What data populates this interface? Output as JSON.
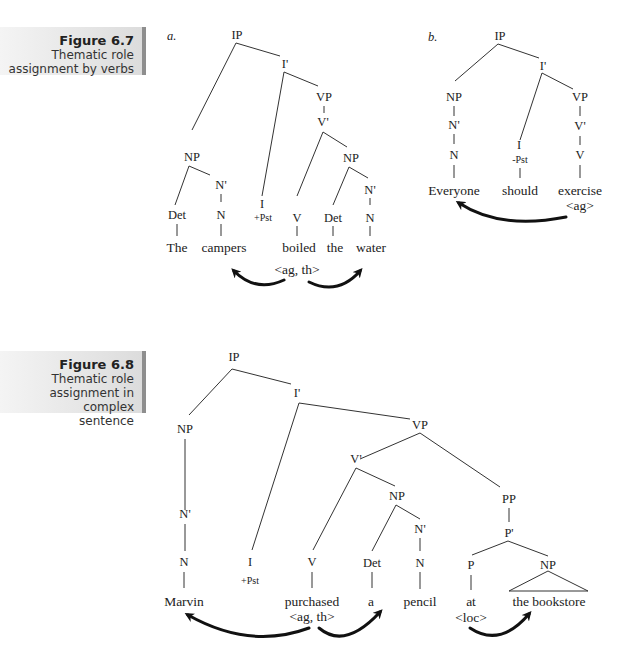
{
  "figures": [
    {
      "number": "Figure 6.7",
      "caption_lines": [
        "Thematic role",
        "assignment by verbs"
      ],
      "panels": [
        {
          "label": "a.",
          "nodes": {
            "ip": "IP",
            "ibar": "I'",
            "vp": "VP",
            "vbar": "V'",
            "np_subj": "NP",
            "nbar_subj": "N'",
            "det1": "Det",
            "n1": "N",
            "i": "I",
            "i_feat": "+Pst",
            "v": "V",
            "np_obj": "NP",
            "det2": "Det",
            "nbar_obj": "N'",
            "n2": "N"
          },
          "words": [
            "The",
            "campers",
            "boiled",
            "the",
            "water"
          ],
          "theta_grid": "<ag, th>"
        },
        {
          "label": "b.",
          "nodes": {
            "ip": "IP",
            "ibar": "I'",
            "np": "NP",
            "nbar": "N'",
            "n": "N",
            "i": "I",
            "i_feat": "-Pst",
            "vp": "VP",
            "vbar": "V'",
            "v": "V"
          },
          "words": [
            "Everyone",
            "should",
            "exercise"
          ],
          "theta_grid": "<ag>"
        }
      ]
    },
    {
      "number": "Figure 6.8",
      "caption_lines": [
        "Thematic role",
        "assignment in complex",
        "sentence"
      ],
      "nodes": {
        "ip": "IP",
        "ibar": "I'",
        "np_subj": "NP",
        "nbar_subj": "N'",
        "n_subj": "N",
        "i": "I",
        "i_feat": "+Pst",
        "vp": "VP",
        "vbar": "V'",
        "v": "V",
        "np_obj": "NP",
        "det": "Det",
        "nbar_obj": "N'",
        "n_obj": "N",
        "pp": "PP",
        "pbar": "P'",
        "p": "P",
        "np_pp": "NP"
      },
      "words": [
        "Marvin",
        "purchased",
        "a",
        "pencil",
        "at",
        "the bookstore"
      ],
      "theta_grid_verb": "<ag, th>",
      "theta_grid_prep": "<loc>"
    }
  ]
}
